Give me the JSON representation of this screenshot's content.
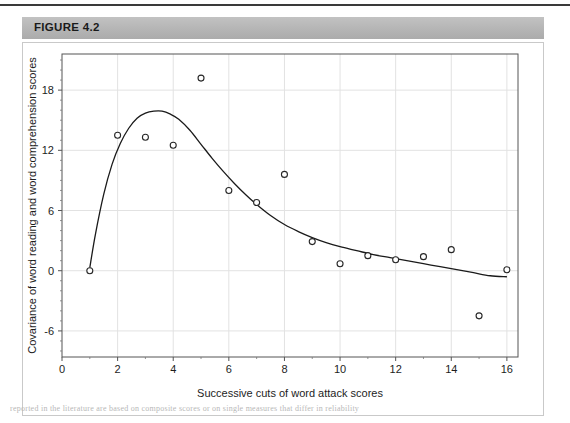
{
  "figure": {
    "header_label": "FIGURE 4.2",
    "header_bg": "#b9b9b9"
  },
  "caption_fragment": "reported in the literature are based on composite scores or on single measures that differ in reliability",
  "chart_data": {
    "type": "scatter",
    "title": "",
    "xlabel": "Successive cuts of word attack scores",
    "ylabel": "Covariance of word reading and word comprehension scores",
    "xlim": [
      0,
      16.4
    ],
    "ylim": [
      -8.6,
      21.6
    ],
    "xticks": [
      0,
      2,
      4,
      6,
      8,
      10,
      12,
      14,
      16
    ],
    "xticklabels": [
      "0",
      "2",
      "4",
      "6",
      "8",
      "10",
      "12",
      "14",
      "16"
    ],
    "yticks": [
      -6,
      0,
      6,
      12,
      18
    ],
    "yticklabels": [
      "-6",
      "0",
      "6",
      "12",
      "18"
    ],
    "grid": true,
    "legend": "none",
    "marker": "open-circle",
    "marker_color": "#262626",
    "line_color": "#1a1a1a",
    "x": [
      1,
      2,
      3,
      4,
      5,
      6,
      7,
      8,
      9,
      10,
      11,
      12,
      13,
      14,
      15,
      16
    ],
    "y": [
      0.0,
      13.5,
      13.3,
      12.5,
      19.2,
      8.0,
      6.8,
      9.6,
      2.9,
      0.7,
      1.5,
      1.1,
      1.4,
      2.1,
      -4.5,
      0.1
    ],
    "series": [
      {
        "name": "observed covariance",
        "type": "scatter",
        "x": [
          1,
          2,
          3,
          4,
          5,
          6,
          7,
          8,
          9,
          10,
          11,
          12,
          13,
          14,
          15,
          16
        ],
        "values": [
          0.0,
          13.5,
          13.3,
          12.5,
          19.2,
          8.0,
          6.8,
          9.6,
          2.9,
          0.7,
          1.5,
          1.1,
          1.4,
          2.1,
          -4.5,
          0.1
        ]
      },
      {
        "name": "fitted curve",
        "type": "line",
        "x": [
          1.0,
          1.2,
          1.5,
          1.8,
          2.1,
          2.4,
          2.7,
          3.0,
          3.3,
          3.6,
          3.9,
          4.2,
          4.6,
          5.0,
          5.4,
          5.8,
          6.2,
          6.6,
          7.0,
          7.5,
          8.0,
          8.5,
          9.0,
          9.5,
          10.0,
          10.6,
          11.2,
          11.8,
          12.4,
          13.0,
          13.6,
          14.2,
          14.8,
          15.4,
          16.0
        ],
        "values": [
          0.3,
          3.6,
          7.6,
          10.6,
          12.7,
          14.2,
          15.2,
          15.7,
          15.9,
          15.9,
          15.6,
          15.1,
          14.0,
          12.6,
          11.2,
          9.9,
          8.7,
          7.6,
          6.6,
          5.5,
          4.6,
          3.9,
          3.3,
          2.8,
          2.4,
          2.0,
          1.6,
          1.3,
          1.0,
          0.7,
          0.4,
          0.1,
          -0.2,
          -0.5,
          -0.6
        ]
      }
    ]
  }
}
